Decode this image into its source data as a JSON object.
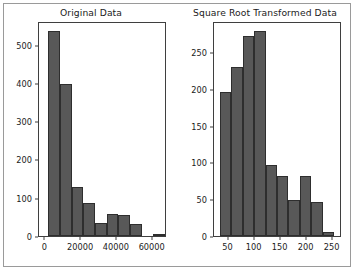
{
  "figure": {
    "background_color": "#ffffff",
    "frame_color": "#9a9a9a",
    "bar_fill_color": "#585858",
    "bar_edge_color": "#2e2e2e",
    "axes_edge_color": "#3f3f3f",
    "text_color": "#1b1b1b"
  },
  "chart_data": [
    {
      "type": "bar",
      "title": "Original Data",
      "xlabel": "",
      "ylabel": "",
      "grid": false,
      "legend": "none",
      "xlim": [
        -3500,
        68000
      ],
      "ylim": [
        0,
        562
      ],
      "xticks": [
        0,
        20000,
        40000,
        60000
      ],
      "xtick_labels": [
        "0",
        "20000",
        "40000",
        "60000"
      ],
      "yticks": [
        0,
        100,
        200,
        300,
        400,
        500
      ],
      "ytick_labels": [
        "0",
        "100",
        "200",
        "300",
        "400",
        "500"
      ],
      "bin_edges": [
        1800,
        8300,
        14800,
        21300,
        27800,
        34300,
        40800,
        47300,
        53800,
        60300,
        66800
      ],
      "categories": [
        "1800-8300",
        "8300-14800",
        "14800-21300",
        "21300-27800",
        "27800-34300",
        "34300-40800",
        "40800-47300",
        "47300-53800",
        "53800-60300",
        "60300-66800"
      ],
      "values": [
        535,
        398,
        128,
        86,
        35,
        58,
        56,
        31,
        0,
        2
      ]
    },
    {
      "type": "bar",
      "title": "Square Root Transformed Data",
      "xlabel": "",
      "ylabel": "",
      "grid": false,
      "legend": "none",
      "xlim": [
        22,
        268
      ],
      "ylim": [
        0,
        292
      ],
      "xticks": [
        50,
        100,
        150,
        200,
        250
      ],
      "xtick_labels": [
        "50",
        "100",
        "150",
        "200",
        "250"
      ],
      "yticks": [
        0,
        50,
        100,
        150,
        200,
        250
      ],
      "ytick_labels": [
        "0",
        "50",
        "100",
        "150",
        "200",
        "250"
      ],
      "bin_edges": [
        33,
        55,
        77,
        99,
        121,
        143,
        165,
        187,
        209,
        231,
        253
      ],
      "categories": [
        "33-55",
        "55-77",
        "77-99",
        "99-121",
        "121-143",
        "143-165",
        "165-187",
        "187-209",
        "209-231",
        "231-253"
      ],
      "values": [
        196,
        229,
        271,
        278,
        97,
        82,
        49,
        81,
        46,
        5
      ]
    }
  ]
}
